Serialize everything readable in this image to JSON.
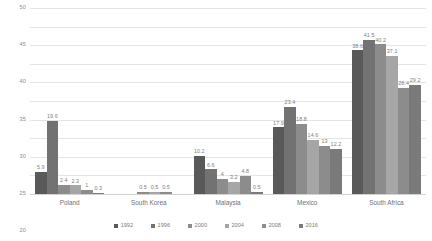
{
  "chart_data": {
    "type": "bar",
    "title": "",
    "subtitle": "",
    "xlabel": "",
    "ylabel": "",
    "ylim": [
      0,
      50
    ],
    "ytick_step": 5,
    "yticks": [
      "0",
      "5",
      "10",
      "15",
      "20",
      "25",
      "30",
      "35",
      "40",
      "45",
      "50"
    ],
    "grid": true,
    "legend_position": "bottom",
    "categories": [
      "Poland",
      "South Korea",
      "Malaysia",
      "Mexico",
      "South Africa"
    ],
    "series": [
      {
        "name": "1992",
        "color": "#595959",
        "values": [
          5.9,
          null,
          10.2,
          17.9,
          38.6
        ],
        "labels": [
          "5.9",
          "",
          "10.2",
          "17.9",
          "38.6"
        ]
      },
      {
        "name": "1996",
        "color": "#727272",
        "values": [
          19.6,
          null,
          6.6,
          23.4,
          41.5
        ],
        "labels": [
          "19.6",
          "",
          "6.6",
          "23.4",
          "41.5"
        ]
      },
      {
        "name": "2000",
        "color": "#8c8c8c",
        "values": [
          2.4,
          0.5,
          4,
          18.8,
          40.2
        ],
        "labels": [
          "2.4",
          "0.5",
          "4",
          "18.8",
          "40.2"
        ]
      },
      {
        "name": "2004",
        "color": "#a6a6a6",
        "values": [
          2.3,
          0.5,
          3.2,
          14.6,
          37.1
        ],
        "labels": [
          "2.3",
          "0.5",
          "3.2",
          "14.6",
          "37.1"
        ]
      },
      {
        "name": "2008",
        "color": "#8c8c8c",
        "values": [
          1,
          0.5,
          4.8,
          13,
          28.4
        ],
        "labels": [
          "1",
          "0.5",
          "4.8",
          "13",
          "28.4"
        ]
      },
      {
        "name": "2016",
        "color": "#7a7a7a",
        "values": [
          0.3,
          null,
          0.5,
          12.2,
          29.2
        ],
        "labels": [
          "0.3",
          "",
          "0.5",
          "12.2",
          "29.2"
        ]
      }
    ]
  },
  "legend": {
    "entries": [
      {
        "label": "1992",
        "color": "#595959"
      },
      {
        "label": "1996",
        "color": "#727272"
      },
      {
        "label": "2000",
        "color": "#8c8c8c"
      },
      {
        "label": "2004",
        "color": "#a6a6a6"
      },
      {
        "label": "2008",
        "color": "#8c8c8c"
      },
      {
        "label": "2016",
        "color": "#7a7a7a"
      }
    ]
  },
  "colors": {
    "gridline": "#e4e4e4",
    "axis": "#d2d2d2",
    "text": "#7d7d7d",
    "background": "#ffffff"
  }
}
